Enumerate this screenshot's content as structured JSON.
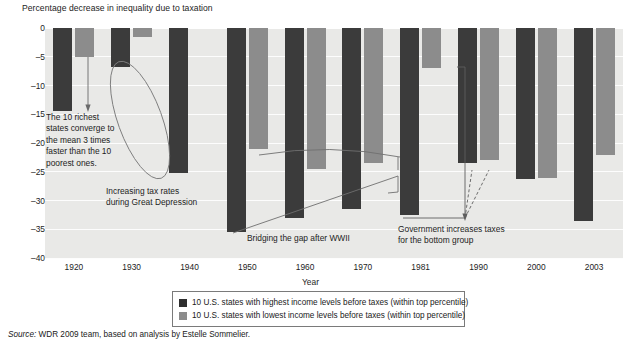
{
  "axis_title": "Percentage decrease in inequality due to taxation",
  "xaxis_label": "Year",
  "source": {
    "label": "Source:",
    "text": "WDR 2009 team, based on analysis by Estelle Sommelier."
  },
  "legend": {
    "items": [
      {
        "color": "#2e2e2e",
        "label": "10 U.S. states with highest income levels before taxes (within top percentile)"
      },
      {
        "color": "#8c8c8c",
        "label": "10 U.S. states with lowest income levels before taxes (within top percentile)"
      }
    ]
  },
  "annotations": {
    "richest": "The 10 richest states converge to the mean 3 times faster than the 10 poorest ones.",
    "depression": "Increasing tax rates during Great Depression",
    "bridging": "Bridging the gap after WWII",
    "government": "Government increases taxes for the bottom group"
  },
  "chart_data": {
    "type": "bar",
    "title": "Percentage decrease in inequality due to taxation",
    "xlabel": "Year",
    "ylabel": "Percentage decrease in inequality due to taxation",
    "ylim": [
      -40,
      0
    ],
    "yticks": [
      0,
      -5,
      -10,
      -15,
      -20,
      -25,
      -30,
      -35,
      -40
    ],
    "ytick_labels": [
      "0",
      "–5",
      "–10",
      "–15",
      "–20",
      "–25",
      "–30",
      "–35",
      "–40"
    ],
    "categories": [
      "1920",
      "1930",
      "1940",
      "1950",
      "1960",
      "1970",
      "1981",
      "1990",
      "2000",
      "2003"
    ],
    "grid": true,
    "legend_position": "bottom",
    "colors": {
      "highest": "#3b3b3b",
      "lowest": "#8c8c8c",
      "plot_background": "#e9e9e7",
      "gridline": "#fdfdfd"
    },
    "series": [
      {
        "name": "10 U.S. states with highest income levels before taxes (within top percentile)",
        "color": "#3b3b3b",
        "values": [
          -14.5,
          -6.8,
          -25.3,
          -35.5,
          -33.0,
          -31.5,
          -32.5,
          -23.5,
          -26.3,
          -33.5
        ]
      },
      {
        "name": "10 U.S. states with lowest income levels before taxes (within top percentile)",
        "color": "#8c8c8c",
        "values": [
          -5.0,
          -1.5,
          null,
          -21.0,
          -24.5,
          -23.5,
          -7.0,
          -23.0,
          -26.0,
          -22.0
        ]
      }
    ]
  }
}
